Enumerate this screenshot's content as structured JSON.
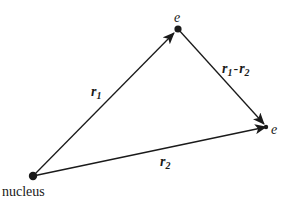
{
  "diagram": {
    "type": "vector-diagram",
    "colors": {
      "line": "#1a1a1a",
      "background": "#ffffff"
    },
    "nodes": {
      "nucleus": {
        "label": "nucleus",
        "x": 33,
        "y": 176
      },
      "electron1": {
        "label": "e",
        "x": 178,
        "y": 29
      },
      "electron2": {
        "label": "e",
        "x": 266,
        "y": 127
      }
    },
    "vectors": {
      "r1": {
        "symbol": "r",
        "subscript": "1",
        "from": "nucleus",
        "to": "electron1"
      },
      "r2": {
        "symbol": "r",
        "subscript": "2",
        "from": "nucleus",
        "to": "electron2"
      },
      "r12": {
        "symbol1": "r",
        "subscript1": "1",
        "operator": "-",
        "symbol2": "r",
        "subscript2": "2",
        "from": "electron1",
        "to": "electron2"
      }
    }
  }
}
